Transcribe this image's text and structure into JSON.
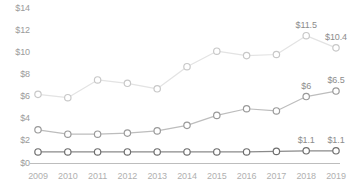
{
  "chart_data": {
    "type": "line",
    "title": "",
    "subtitle": "",
    "xlabel": "",
    "ylabel": "",
    "grid": false,
    "legend_position": "none",
    "categories": [
      "2009",
      "2010",
      "2011",
      "2012",
      "2013",
      "2014",
      "2015",
      "2016",
      "2017",
      "2018",
      "2019"
    ],
    "x_tick_labels": [
      "2009",
      "2010",
      "2011",
      "2012",
      "2013",
      "2014",
      "2015",
      "2016",
      "2017",
      "2018",
      "2019"
    ],
    "y_tick_labels": [
      "$0",
      "$2",
      "$4",
      "$6",
      "$8",
      "$10",
      "$12",
      "$14"
    ],
    "y_tick_values": [
      0,
      2,
      4,
      6,
      8,
      10,
      12,
      14
    ],
    "ylim": [
      0,
      14.1
    ],
    "currency_prefix": "$",
    "series": [
      {
        "name": "series-top",
        "color": "#e3e3e3",
        "marker_color": "#c8c8c8",
        "values": [
          6.2,
          5.9,
          7.5,
          7.2,
          6.7,
          8.7,
          10.1,
          9.7,
          9.8,
          11.5,
          10.4
        ],
        "labels": [
          "",
          "",
          "",
          "",
          "",
          "",
          "",
          "",
          "",
          "$11.5",
          "$10.4"
        ]
      },
      {
        "name": "series-middle",
        "color": "#bdbdbd",
        "marker_color": "#9a9a9a",
        "values": [
          3.0,
          2.6,
          2.6,
          2.7,
          2.9,
          3.4,
          4.3,
          4.9,
          4.7,
          6.0,
          6.5
        ],
        "labels": [
          "",
          "",
          "",
          "",
          "",
          "",
          "",
          "",
          "",
          "$6",
          "$6.5"
        ]
      },
      {
        "name": "series-bottom",
        "color": "#8a8a8a",
        "marker_color": "#6e6e6e",
        "values": [
          1.0,
          1.0,
          1.0,
          1.0,
          1.0,
          1.0,
          1.0,
          1.0,
          1.05,
          1.1,
          1.1
        ],
        "labels": [
          "",
          "",
          "",
          "",
          "",
          "",
          "",
          "",
          "",
          "$1.1",
          "$1.1"
        ]
      }
    ],
    "axis_line_color": "#bdbdbd"
  },
  "layout": {
    "plot_left": 38,
    "plot_right": 336,
    "baseline_y": 163,
    "top_value_y": 8,
    "axis_label_color": "#9b9b9b"
  }
}
